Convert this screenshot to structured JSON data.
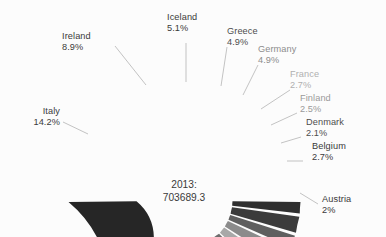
{
  "chart_data": {
    "type": "pie",
    "variant": "half-donut",
    "title": "",
    "subtitle": "",
    "xlabel": "",
    "ylabel": "",
    "legend_position": "none",
    "grid": false,
    "center_label": {
      "line1": "2013:",
      "line2": "703689.3"
    },
    "total_value": 703689.3,
    "year": "2013",
    "slice_order": "counterclockwise-from-left",
    "categories": [
      "Italy",
      "Ireland",
      "Iceland",
      "Greece",
      "Germany",
      "France",
      "Finland",
      "Denmark",
      "Belgium",
      "Austria"
    ],
    "values": [
      14.2,
      8.9,
      5.1,
      4.9,
      4.9,
      2.7,
      2.5,
      2.1,
      2.7,
      2.0
    ],
    "value_labels": [
      "14.2%",
      "8.9%",
      "5.1%",
      "4.9%",
      "4.9%",
      "2.7%",
      "2.5%",
      "2.1%",
      "2.7%",
      "2%"
    ],
    "colors": [
      "#262626",
      "#3f3f3f",
      "#4a4a4a",
      "#575757",
      "#6e6e6e",
      "#a8a8a8",
      "#8b8b8b",
      "#5f5f5f",
      "#3b3b3b",
      "#2e2e2e"
    ],
    "series": [
      {
        "name": "Share of total",
        "values": [
          14.2,
          8.9,
          5.1,
          4.9,
          4.9,
          2.7,
          2.5,
          2.1,
          2.7,
          2.0
        ]
      }
    ],
    "slices": [
      {
        "label": "Italy",
        "value_label": "14.2%",
        "value": 14.2,
        "color": "#262626"
      },
      {
        "label": "Ireland",
        "value_label": "8.9%",
        "value": 8.9,
        "color": "#3f3f3f"
      },
      {
        "label": "Iceland",
        "value_label": "5.1%",
        "value": 5.1,
        "color": "#4a4a4a"
      },
      {
        "label": "Greece",
        "value_label": "4.9%",
        "value": 4.9,
        "color": "#575757"
      },
      {
        "label": "Germany",
        "value_label": "4.9%",
        "value": 4.9,
        "color": "#6e6e6e"
      },
      {
        "label": "France",
        "value_label": "2.7%",
        "value": 2.7,
        "color": "#a8a8a8"
      },
      {
        "label": "Finland",
        "value_label": "2.5%",
        "value": 2.5,
        "color": "#8b8b8b"
      },
      {
        "label": "Denmark",
        "value_label": "2.1%",
        "value": 2.1,
        "color": "#5f5f5f"
      },
      {
        "label": "Belgium",
        "value_label": "2.7%",
        "value": 2.7,
        "color": "#3b3b3b"
      },
      {
        "label": "Austria",
        "value_label": "2%",
        "value": 2.0,
        "color": "#2e2e2e"
      }
    ]
  },
  "labels": {
    "italy": {
      "name": "Italy",
      "pct": "14.2%"
    },
    "ireland": {
      "name": "Ireland",
      "pct": "8.9%"
    },
    "iceland": {
      "name": "Iceland",
      "pct": "5.1%"
    },
    "greece": {
      "name": "Greece",
      "pct": "4.9%"
    },
    "germany": {
      "name": "Germany",
      "pct": "4.9%"
    },
    "france": {
      "name": "France",
      "pct": "2.7%"
    },
    "finland": {
      "name": "Finland",
      "pct": "2.5%"
    },
    "denmark": {
      "name": "Denmark",
      "pct": "2.1%"
    },
    "belgium": {
      "name": "Belgium",
      "pct": "2.7%"
    },
    "austria": {
      "name": "Austria",
      "pct": "2%"
    }
  },
  "center": {
    "line1": "2013:",
    "line2": "703689.3"
  },
  "style": {
    "background": "#fcfcfc",
    "leader_line_color": "#b4b4b4",
    "divider_color": "#fcfcfc",
    "text_dark": "#3a3a3a",
    "text_mid": "#6a6a6a",
    "text_light": "#9a9a9a"
  }
}
